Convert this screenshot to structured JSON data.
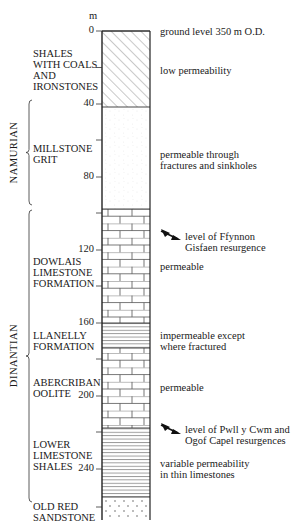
{
  "diagram": {
    "type": "stratigraphic-column",
    "scale_unit": "m",
    "ticks": [
      {
        "value": "0",
        "y": 31
      },
      {
        "value": "40",
        "y": 104
      },
      {
        "value": "80",
        "y": 177
      },
      {
        "value": "120",
        "y": 250
      },
      {
        "value": "160",
        "y": 323
      },
      {
        "value": "200",
        "y": 396
      },
      {
        "value": "240",
        "y": 469
      }
    ],
    "systems": [
      {
        "name": "NAMURIAN",
        "from_y": 100,
        "to_y": 205
      },
      {
        "name": "DINANTIAN",
        "from_y": 210,
        "to_y": 502
      }
    ],
    "units": [
      {
        "name": "SHALES\nWITH COALS\nAND\nIRONSTONES",
        "pattern": "diagonal-hatch",
        "top_y": 31,
        "bottom_y": 107,
        "label_y": 48,
        "note": "low permeability",
        "note_y": 65
      },
      {
        "name": "MILLSTONE\nGRIT",
        "pattern": "stipple",
        "top_y": 107,
        "bottom_y": 209,
        "label_y": 143,
        "note": "permeable through\nfractures and sinkholes",
        "note_y": 149
      },
      {
        "name": "DOWLAIS\nLIMESTONE\nFORMATION",
        "pattern": "limestone-brick",
        "top_y": 209,
        "bottom_y": 323,
        "label_y": 256,
        "note": "permeable",
        "note_y": 261
      },
      {
        "name": "LLANELLY\nFORMATION",
        "pattern": "horizontal-lines",
        "top_y": 323,
        "bottom_y": 348,
        "label_y": 330,
        "note": "impermeable except\nwhere fractured",
        "note_y": 330
      },
      {
        "name": "ABERCRIBAN\nOOLITE",
        "pattern": "limestone-brick",
        "top_y": 348,
        "bottom_y": 428,
        "label_y": 377,
        "note": "permeable",
        "note_y": 382
      },
      {
        "name": "LOWER\nLIMESTONE\nSHALES",
        "pattern": "horizontal-lines",
        "top_y": 428,
        "bottom_y": 497,
        "label_y": 439,
        "note": "variable permeability\nin thin limestones",
        "note_y": 458
      },
      {
        "name": "OLD RED\nSANDSTONE",
        "pattern": "dotted",
        "top_y": 497,
        "bottom_y": 520,
        "label_y": 501,
        "note": "",
        "note_y": 0
      }
    ],
    "annotations": [
      {
        "text": "ground level 350 m O.D.",
        "y": 26,
        "arrow": false
      },
      {
        "text": "level of Ffynnon\nGisfaen resurgence",
        "y": 231,
        "arrow": true,
        "arrow_y": 236
      },
      {
        "text": "level of Pwll y Cwm and\nOgof Capel resurgences",
        "y": 424,
        "arrow": true,
        "arrow_y": 430
      }
    ],
    "colors": {
      "ink": "#1a1a1a",
      "pattern": "#666666",
      "background": "#ffffff"
    }
  }
}
